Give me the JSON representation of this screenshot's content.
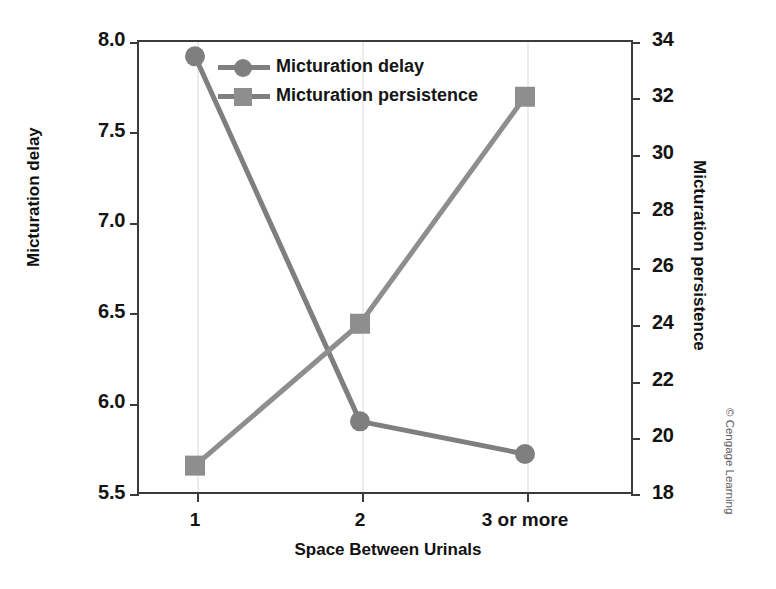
{
  "chart_data": {
    "type": "line",
    "title": "",
    "xlabel": "Space Between Urinals",
    "categories": [
      "1",
      "2",
      "3 or more"
    ],
    "grid": "vertical-only",
    "legend_position": "top-center",
    "axes": {
      "left": {
        "label": "Micturation delay",
        "ticks": [
          "5.5",
          "6.0",
          "6.5",
          "7.0",
          "7.5",
          "8.0"
        ],
        "tick_values": [
          5.5,
          6.0,
          6.5,
          7.0,
          7.5,
          8.0
        ],
        "ylim": [
          5.5,
          8.0
        ]
      },
      "right": {
        "label": "Micturation persistence",
        "ticks": [
          "18",
          "20",
          "22",
          "24",
          "26",
          "28",
          "30",
          "32",
          "34"
        ],
        "tick_values": [
          18,
          20,
          22,
          24,
          26,
          28,
          30,
          32,
          34
        ],
        "ylim": [
          18,
          34
        ]
      }
    },
    "series": [
      {
        "name": "Micturation delay",
        "axis": "left",
        "marker": "circle",
        "color": "#7f7f7f",
        "values": [
          7.91,
          5.9,
          5.72
        ]
      },
      {
        "name": "Micturation persistence",
        "axis": "right",
        "marker": "square",
        "color": "#8e8e8e",
        "values": [
          19.0,
          24.0,
          32.0
        ]
      }
    ]
  },
  "legend": {
    "items": [
      {
        "label": "Micturation delay",
        "marker": "circle"
      },
      {
        "label": "Micturation persistence",
        "marker": "square"
      }
    ]
  },
  "credit": {
    "text": "© Cengage Learning"
  },
  "colors": {
    "series": "#7f7f7f",
    "axis": "#3b3b3b",
    "gridline": "#ececec",
    "text": "#141414",
    "credit": "#5d5d5d"
  }
}
